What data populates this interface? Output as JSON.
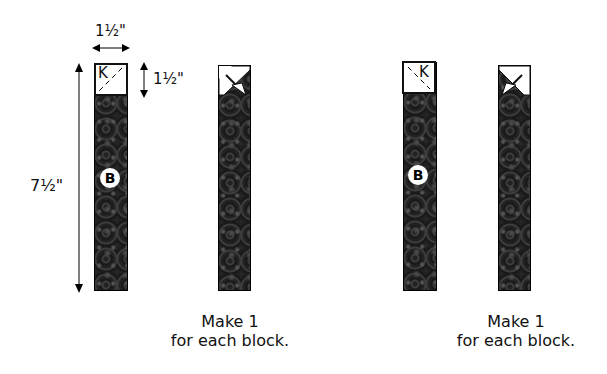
{
  "diagram": {
    "dimensions": {
      "width": "1½\"",
      "k_height": "1½\"",
      "strip_length": "7½\""
    },
    "labels": {
      "k": "K",
      "b": "B"
    },
    "units": [
      {
        "id": "unit-left",
        "caption_line1": "Make 1",
        "caption_line2": "for each block."
      },
      {
        "id": "unit-right",
        "caption_line1": "Make 1",
        "caption_line2": "for each block."
      }
    ]
  }
}
